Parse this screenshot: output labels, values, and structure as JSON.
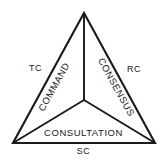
{
  "diagram": {
    "type": "triangle-partition-diagram",
    "background_color": "#ffffff",
    "line_color": "#1a1a1a",
    "text_color": "#1a1a1a",
    "geometry": {
      "apex": [
        84,
        13
      ],
      "bottom_left": [
        13,
        143
      ],
      "bottom_right": [
        155,
        143
      ],
      "centroid": [
        84,
        100
      ],
      "outline_stroke_width": 2.1,
      "inner_stroke_width": 1.9
    },
    "sectors": [
      {
        "id": "left",
        "label": "COMMAND",
        "rotation_deg": -61
      },
      {
        "id": "right",
        "label": "CONSENSUS",
        "rotation_deg": 61
      },
      {
        "id": "bottom",
        "label": "CONSULTATION",
        "rotation_deg": 0
      }
    ],
    "corners": [
      {
        "id": "left",
        "label": "TC"
      },
      {
        "id": "right",
        "label": "RC"
      },
      {
        "id": "bottom",
        "label": "SC"
      }
    ]
  }
}
